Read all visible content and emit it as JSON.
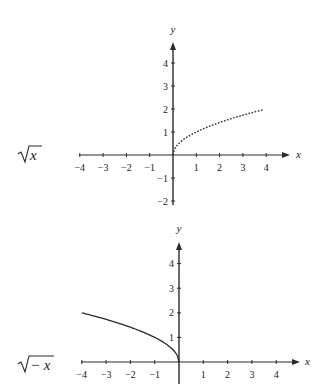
{
  "chart_data": [
    {
      "type": "line",
      "title": "",
      "function_label": "√x",
      "xlabel": "x",
      "ylabel": "y",
      "xlim": [
        -4,
        4
      ],
      "ylim": [
        -2,
        4
      ],
      "x_ticks": [
        -4,
        -3,
        -2,
        -1,
        1,
        2,
        3,
        4
      ],
      "y_ticks": [
        -2,
        -1,
        1,
        2,
        3,
        4
      ],
      "grid": false,
      "series": [
        {
          "name": "sqrt(x)",
          "style": "dotted",
          "x": [
            0,
            0.25,
            0.5,
            1,
            1.5,
            2,
            2.5,
            3,
            3.5,
            3.9
          ],
          "y": [
            0,
            0.5,
            0.71,
            1,
            1.22,
            1.41,
            1.58,
            1.73,
            1.87,
            1.97
          ]
        }
      ]
    },
    {
      "type": "line",
      "title": "",
      "function_label": "√−x",
      "xlabel": "x",
      "ylabel": "y",
      "xlim": [
        -4,
        4
      ],
      "ylim": [
        -1,
        4
      ],
      "x_ticks": [
        -4,
        -3,
        -2,
        -1,
        1,
        2,
        3,
        4
      ],
      "y_ticks": [
        -1,
        1,
        2,
        3,
        4
      ],
      "grid": false,
      "series": [
        {
          "name": "sqrt(-x)",
          "style": "solid",
          "x": [
            -4,
            -3.5,
            -3,
            -2.5,
            -2,
            -1.5,
            -1,
            -0.5,
            -0.25,
            0
          ],
          "y": [
            2,
            1.87,
            1.73,
            1.58,
            1.41,
            1.22,
            1,
            0.71,
            0.5,
            0
          ]
        }
      ]
    }
  ],
  "labels": {
    "top_function": "√x",
    "bottom_function_radical": "√",
    "bottom_function_arg": "− x",
    "top_function_radical": "√",
    "top_function_arg": "x",
    "x_axis": "x",
    "y_axis": "y"
  }
}
